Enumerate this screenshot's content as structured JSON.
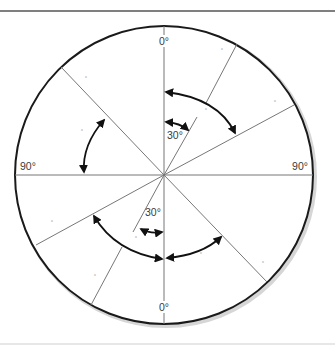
{
  "figure": {
    "frame": {
      "top_rule_y": 11,
      "bottom_rule_y": 344,
      "top_rule_color": "#555555",
      "bottom_rule_color": "#cfcfcf"
    },
    "circle": {
      "cx": 164,
      "cy": 175,
      "r": 149,
      "stroke": "#1a1a1a",
      "shadow": "#d6d6d6"
    },
    "axes": {
      "vertical": {
        "x": 164,
        "y1": 26,
        "y2": 324
      },
      "horizontal": {
        "y": 175,
        "x1": 15,
        "x2": 313
      },
      "line_color": "#777777"
    },
    "labels": {
      "top": "0°",
      "bottom": "0°",
      "left": "90°",
      "right": "90°",
      "inner_upper": "30°",
      "inner_lower": "30°"
    },
    "sector_lines": [
      {
        "name": "upper-right-30-inner",
        "x1": 164,
        "y1": 175,
        "x2": 197,
        "y2": 117
      },
      {
        "name": "upper-right-30-outer",
        "x1": 206,
        "y1": 103,
        "x2": 237,
        "y2": 44
      },
      {
        "name": "upper-right-60",
        "x1": 164,
        "y1": 175,
        "x2": 294,
        "y2": 105
      },
      {
        "name": "upper-left-45",
        "x1": 164,
        "y1": 175,
        "x2": 61,
        "y2": 67
      },
      {
        "name": "lower-left-60",
        "x1": 164,
        "y1": 175,
        "x2": 36,
        "y2": 245
      },
      {
        "name": "lower-left-30-inner",
        "x1": 164,
        "y1": 175,
        "x2": 133,
        "y2": 232
      },
      {
        "name": "lower-left-30-outer",
        "x1": 122,
        "y1": 247,
        "x2": 91,
        "y2": 305
      },
      {
        "name": "lower-right-45",
        "x1": 164,
        "y1": 175,
        "x2": 267,
        "y2": 282
      }
    ],
    "arcs": [
      {
        "name": "upper-right-arc",
        "d": "M 166 92 Q 218 98 235 133"
      },
      {
        "name": "upper-left-arc",
        "d": "M 104 120 Q 82 145 84 172"
      },
      {
        "name": "lower-left-arc",
        "d": "M 94 216 Q 115 252 162 259"
      },
      {
        "name": "lower-right-arc",
        "d": "M 167 258 Q 202 255 221 237"
      },
      {
        "name": "upper-inner-30-arc",
        "d": "M 166 122 Q 180 123 188 130"
      },
      {
        "name": "lower-inner-30-arc",
        "d": "M 141 229 Q 150 234 162 232"
      }
    ],
    "arrow_color": "#111111",
    "dots": [
      {
        "x": 222,
        "y": 52
      },
      {
        "x": 275,
        "y": 104
      },
      {
        "x": 206,
        "y": 112
      },
      {
        "x": 86,
        "y": 80
      },
      {
        "x": 82,
        "y": 133
      },
      {
        "x": 52,
        "y": 224
      },
      {
        "x": 136,
        "y": 240
      },
      {
        "x": 95,
        "y": 278
      },
      {
        "x": 201,
        "y": 256
      },
      {
        "x": 263,
        "y": 265
      }
    ],
    "dot_glyph": "°"
  }
}
